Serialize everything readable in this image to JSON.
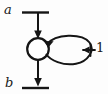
{
  "figure": {
    "type": "signal-flow-diagram",
    "background_color": "#fdfdfd",
    "ink_color": "#151515",
    "labels": {
      "input_label": "a",
      "output_label": "b",
      "loop_weight_label": "1"
    },
    "node": {
      "name": "summing-node",
      "shape": "circle",
      "center_x": 38,
      "center_y": 49,
      "radius": 11
    },
    "edges": [
      {
        "name": "input-branch",
        "from_label": "a",
        "direction": "down",
        "has_arrowhead": true,
        "terminal_bar": true
      },
      {
        "name": "output-branch",
        "to_label": "b",
        "direction": "down",
        "has_arrowhead": true,
        "terminal_bar": true
      },
      {
        "name": "self-loop",
        "shape": "ellipse",
        "has_arrowhead": true,
        "arrow_target": "summing-node"
      },
      {
        "name": "loop-weight-branch",
        "label": "1",
        "direction": "left",
        "has_arrowhead": true
      }
    ]
  }
}
